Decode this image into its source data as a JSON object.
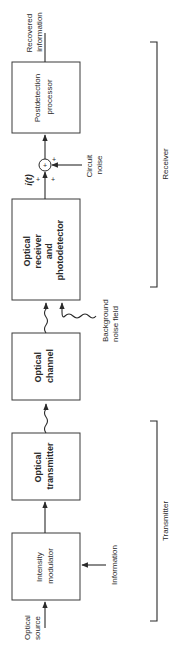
{
  "diagram": {
    "orientation": "rotated-90-ccw",
    "blocks": [
      {
        "id": "intensity-modulator",
        "lines": [
          "Intensity",
          "modulator"
        ],
        "style": "light"
      },
      {
        "id": "optical-transmitter",
        "lines": [
          "Optical",
          "transmitter"
        ],
        "style": "bold"
      },
      {
        "id": "optical-channel",
        "lines": [
          "Optical",
          "channel"
        ],
        "style": "bold"
      },
      {
        "id": "optical-receiver",
        "lines": [
          "Optical",
          "receiver",
          "and",
          "photodetector"
        ],
        "style": "bold"
      },
      {
        "id": "postdetection-processor",
        "lines": [
          "Postdetection",
          "processor"
        ],
        "style": "light"
      }
    ],
    "inputs": {
      "optical_source": [
        "Optical",
        "source"
      ],
      "information": "Information",
      "background_noise": [
        "Background",
        "noise field"
      ],
      "circuit_noise": [
        "Circuit",
        "noise"
      ]
    },
    "output": [
      "Recovered",
      "information"
    ],
    "signal_label": "i(t)",
    "sum_signs": [
      "+",
      "+",
      "+"
    ],
    "sum_symbol": "+",
    "groups": {
      "receiver": "Receiver",
      "transmitter": "Transmitter"
    }
  }
}
